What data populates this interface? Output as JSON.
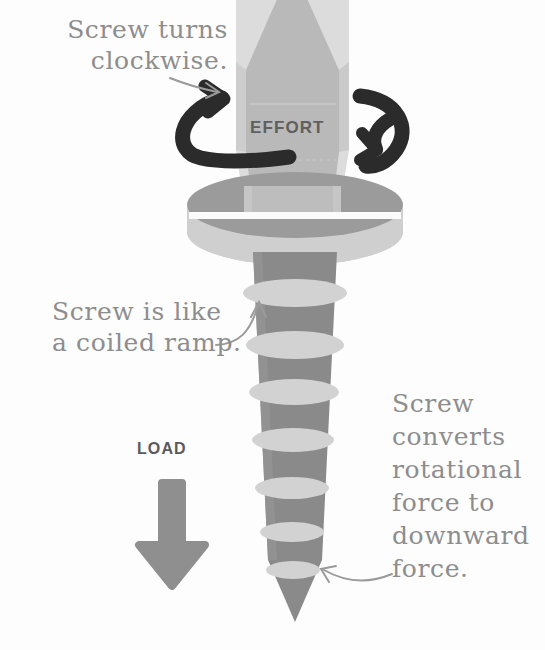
{
  "diagram": {
    "background_color": "#fdfdfd",
    "annotations": {
      "clockwise_note": "Screw turns\nclockwise.",
      "ramp_note": "Screw is like\na coiled ramp.",
      "converts_note": "Screw\nconverts\nrotational\nforce to\ndownward\nforce."
    },
    "labels": {
      "effort": "EFFORT",
      "load": "LOAD"
    },
    "colors": {
      "handwriting": "#8d8d8d",
      "effort_text": "#5f5f5f",
      "load_text": "#5a5a5a",
      "rotation_arrow": "#2b2b2b",
      "load_arrow": "#8f8f8f",
      "handle_light": "#d7d7d7",
      "handle_mid": "#bdbdbd",
      "handle_face": "#b6b6b6",
      "collar_top": "#9b9b9b",
      "collar_band": "#cfcfcf",
      "shaft": "#8a8a8a",
      "thread_ring": "#d2d2d2",
      "leader_line": "#9a9a9a"
    },
    "parts": {
      "handle": "screwdriver-handle",
      "collar": "screw-head-collar",
      "shaft": "threaded-shaft",
      "thread_count": 7,
      "tip": "pointed-tip"
    }
  }
}
